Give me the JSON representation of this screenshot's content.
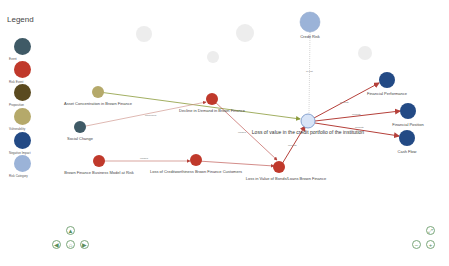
{
  "legend": {
    "title": "Legend",
    "items": [
      {
        "label": "Event",
        "color": "#3f5a66"
      },
      {
        "label": "Risk Event",
        "color": "#c0392b"
      },
      {
        "label": "Proposition",
        "color": "#5a4a1f"
      },
      {
        "label": "Vulnerability",
        "color": "#b5a96a"
      },
      {
        "label": "Negative Impact",
        "color": "#234a85"
      },
      {
        "label": "Risk Category",
        "color": "#9bb3d8"
      }
    ]
  },
  "nodes": {
    "credit_risk": {
      "label": "Credit Risk",
      "color": "#9bb3d8"
    },
    "loss_value_portfolio": {
      "label": "Loss of value in the credit portfolio of the institution",
      "color": "#d8e4f7"
    },
    "financial_performance": {
      "label": "Financial Performance",
      "color": "#234a85"
    },
    "financial_position": {
      "label": "Financial Position",
      "color": "#234a85"
    },
    "cash_flow": {
      "label": "Cash Flow",
      "color": "#234a85"
    },
    "asset_concentration": {
      "label": "Asset Concentration in Brown Finance",
      "color": "#b5a96a"
    },
    "social_change": {
      "label": "Social Change",
      "color": "#3f5a66"
    },
    "decline_demand": {
      "label": "Decline in Demand in Brown Finance",
      "color": "#c0392b"
    },
    "business_model_risk": {
      "label": "Brown Finance Business Model at Risk",
      "color": "#c0392b"
    },
    "loss_creditworthiness": {
      "label": "Loss of Creditworthiness Brown Finance Customers",
      "color": "#c0392b"
    },
    "loss_bonds_loans": {
      "label": "Loss in Value of Bonds/Loans Brown Finance",
      "color": "#c0392b"
    }
  },
  "edges": {
    "is_part": "is part",
    "impacts": "impacts",
    "influences": "influences",
    "causes": "causes"
  },
  "controls": {
    "up": "▲",
    "left": "◀",
    "home": "⌂",
    "right": "▶",
    "fit": "⤢",
    "zoom_out": "−",
    "zoom_in": "+"
  }
}
